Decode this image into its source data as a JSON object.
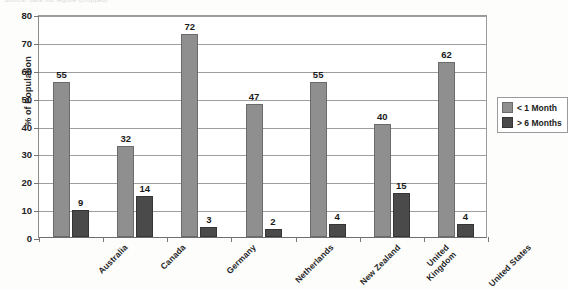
{
  "source_note": "Source: data not legible (cropped)",
  "legend": {
    "position": "right",
    "entries": [
      {
        "label": "< 1 Month",
        "color": "#8f8f8f"
      },
      {
        "label": "> 6 Months",
        "color": "#4a4a4a"
      }
    ]
  },
  "chart_data": {
    "type": "bar",
    "title": "",
    "subtitle": "",
    "xlabel": "",
    "ylabel": "% of Population",
    "ylim": [
      0,
      80
    ],
    "ytick_step": 10,
    "yticks": [
      0,
      10,
      20,
      30,
      40,
      50,
      60,
      70,
      80
    ],
    "ytick_labels": [
      "0",
      "10",
      "20",
      "30",
      "40",
      "50",
      "60",
      "70",
      "80"
    ],
    "grid": true,
    "grid_axis": "y",
    "legend_position": "right",
    "data_labels": true,
    "categories": [
      "Australia",
      "Canada",
      "Germany",
      "Netherlands",
      "New Zealand",
      "United Kingdom",
      "United States"
    ],
    "category_label_rotation": -45,
    "series": [
      {
        "name": "< 1 Month",
        "color": "#8f8f8f",
        "values": [
          55,
          32,
          72,
          47,
          55,
          40,
          62
        ]
      },
      {
        "name": "> 6 Months",
        "color": "#4a4a4a",
        "values": [
          9,
          14,
          3,
          2,
          4,
          15,
          4
        ]
      }
    ]
  }
}
